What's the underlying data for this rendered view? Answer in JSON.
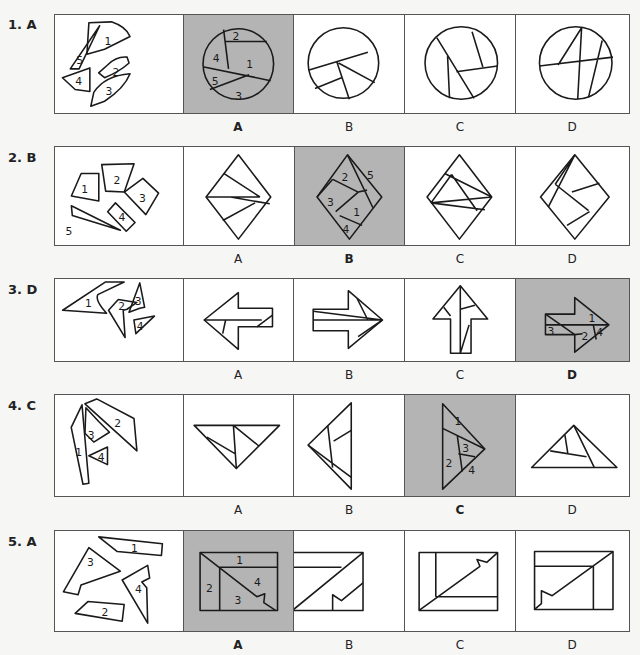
{
  "questions": [
    {
      "number": "1.",
      "answer": "A",
      "label": "1. A",
      "options": [
        "A",
        "B",
        "C",
        "D"
      ],
      "selected": "A",
      "pieces": [
        "1",
        "2",
        "3",
        "4",
        "5"
      ],
      "selected_piece_labels": [
        "2",
        "4",
        "1",
        "5",
        "3"
      ]
    },
    {
      "number": "2.",
      "answer": "B",
      "label": "2. B",
      "options": [
        "A",
        "B",
        "C",
        "D"
      ],
      "selected": "B",
      "pieces": [
        "1",
        "2",
        "3",
        "4",
        "5"
      ],
      "selected_piece_labels": [
        "5",
        "2",
        "3",
        "1",
        "4"
      ]
    },
    {
      "number": "3.",
      "answer": "D",
      "label": "3. D",
      "options": [
        "A",
        "B",
        "C",
        "D"
      ],
      "selected": "D",
      "pieces": [
        "1",
        "2",
        "3",
        "4"
      ],
      "selected_piece_labels": [
        "1",
        "3",
        "2",
        "4"
      ]
    },
    {
      "number": "4.",
      "answer": "C",
      "label": "4. C",
      "options": [
        "A",
        "B",
        "C",
        "D"
      ],
      "selected": "C",
      "pieces": [
        "1",
        "2",
        "3",
        "4"
      ],
      "selected_piece_labels": [
        "1",
        "3",
        "2",
        "4"
      ]
    },
    {
      "number": "5.",
      "answer": "A",
      "label": "5. A",
      "options": [
        "A",
        "B",
        "C",
        "D"
      ],
      "selected": "A",
      "pieces": [
        "1",
        "2",
        "3",
        "4"
      ],
      "selected_piece_labels": [
        "1",
        "4",
        "2",
        "3"
      ]
    }
  ],
  "colors": {
    "selected_bg": "#b4b4b4",
    "border": "#555555",
    "line": "#1a1a1a"
  }
}
